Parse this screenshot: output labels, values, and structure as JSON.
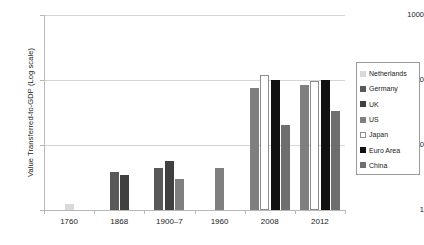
{
  "chart_data": {
    "type": "bar",
    "title": "",
    "xlabel": "",
    "ylabel": "Value Transferred-to-GDP (Log scale)",
    "scale": "log",
    "ylim": [
      1,
      1000
    ],
    "ytick_labels": [
      "1",
      "10",
      "100",
      "1000"
    ],
    "ytick_values": [
      1,
      10,
      100,
      1000
    ],
    "grid": true,
    "legend_position": "right",
    "categories": [
      "1760",
      "1868",
      "1900–7",
      "1960",
      "2008",
      "2012"
    ],
    "series": [
      {
        "name": "Netherlands",
        "color": "#d9d9d9",
        "values": [
          1.25,
          null,
          null,
          null,
          null,
          null
        ]
      },
      {
        "name": "Germany",
        "color": "#595959",
        "values": [
          null,
          3.8,
          4.5,
          null,
          null,
          null
        ]
      },
      {
        "name": "UK",
        "color": "#404040",
        "values": [
          null,
          3.4,
          5.7,
          null,
          null,
          null
        ]
      },
      {
        "name": "US",
        "color": "#7f7f7f",
        "values": [
          null,
          null,
          3.0,
          4.5,
          75,
          85
        ]
      },
      {
        "name": "Japan",
        "color": "#ffffff",
        "values": [
          null,
          null,
          null,
          null,
          120,
          95
        ]
      },
      {
        "name": "Euro Area",
        "color": "#111111",
        "values": [
          null,
          null,
          null,
          null,
          100,
          100
        ]
      },
      {
        "name": "China",
        "color": "#6e6e6e",
        "values": [
          null,
          null,
          null,
          null,
          20,
          33
        ]
      }
    ]
  },
  "axis": {
    "y_title": "Value Transferred-to-GDP (Log scale)",
    "y_ticks": [
      {
        "label": "1000",
        "value": 1000
      },
      {
        "label": "100",
        "value": 100
      },
      {
        "label": "10",
        "value": 10
      },
      {
        "label": "1",
        "value": 1
      }
    ],
    "x_ticks": [
      {
        "label": "1760"
      },
      {
        "label": "1868"
      },
      {
        "label": "1900–7"
      },
      {
        "label": "1960"
      },
      {
        "label": "2008"
      },
      {
        "label": "2012"
      }
    ]
  },
  "legend": {
    "items": [
      {
        "label": "Netherlands",
        "color": "#d9d9d9"
      },
      {
        "label": "Germany",
        "color": "#595959"
      },
      {
        "label": "UK",
        "color": "#404040"
      },
      {
        "label": "US",
        "color": "#7f7f7f"
      },
      {
        "label": "Japan",
        "color": "#ffffff"
      },
      {
        "label": "Euro Area",
        "color": "#111111"
      },
      {
        "label": "China",
        "color": "#6e6e6e"
      }
    ]
  }
}
